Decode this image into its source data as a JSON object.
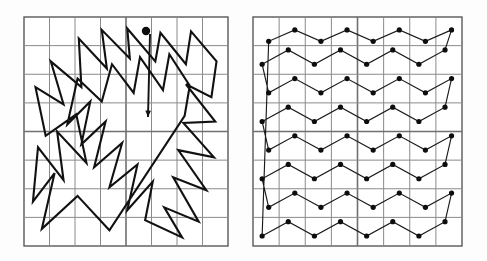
{
  "figure": {
    "background_color": "#fdfdfd",
    "width": 487,
    "height": 261,
    "line_color": "#111111",
    "grid_color": "#8a8a8a",
    "dot_color": "#0d0d0d"
  },
  "panels": [
    {
      "id": "left-panel",
      "label": "Random tour panel",
      "x": 24,
      "y": 17,
      "width": 204,
      "height": 229,
      "columns": 8,
      "rows": 8,
      "major_line_col": 4,
      "major_line_row": 4,
      "has_dots": false,
      "has_start_marker": true,
      "start_marker": {
        "x": 146,
        "y": 31,
        "radius": 4.2
      },
      "arrow": {
        "x1": 150,
        "y1": 34,
        "x2": 148,
        "y2": 117,
        "head_size": 7
      }
    },
    {
      "id": "right-panel",
      "label": "Zigzag tour panel",
      "x": 253,
      "y": 17,
      "width": 209,
      "height": 229,
      "columns": 8,
      "rows": 8,
      "major_line_col": 4,
      "major_line_row": 4,
      "has_dots": true,
      "has_start_marker": false,
      "dot_radius": 2.6,
      "dot_columns": 8,
      "dot_rows": 8
    }
  ],
  "chart_data": {
    "type": "line",
    "xlabel": "",
    "ylabel": "",
    "xlim": [
      0,
      8
    ],
    "ylim": [
      0,
      8
    ],
    "grid": true,
    "legend": "none",
    "series": [
      {
        "name": "Random tour (left panel)",
        "panel": "left-panel",
        "closed": true,
        "points": [
          [
            3.35,
            0.55
          ],
          [
            2.1,
            1.75
          ],
          [
            0.7,
            0.6
          ],
          [
            1.2,
            2.55
          ],
          [
            0.35,
            1.55
          ],
          [
            0.55,
            3.45
          ],
          [
            1.55,
            2.3
          ],
          [
            1.3,
            4.0
          ],
          [
            2.45,
            2.9
          ],
          [
            2.05,
            4.6
          ],
          [
            0.85,
            3.85
          ],
          [
            0.45,
            5.55
          ],
          [
            1.55,
            4.95
          ],
          [
            1.05,
            6.45
          ],
          [
            2.25,
            5.55
          ],
          [
            2.15,
            7.25
          ],
          [
            3.25,
            6.2
          ],
          [
            3.05,
            7.55
          ],
          [
            4.15,
            6.55
          ],
          [
            4.05,
            7.6
          ],
          [
            5.15,
            6.45
          ],
          [
            5.35,
            7.45
          ],
          [
            6.35,
            6.35
          ],
          [
            6.55,
            7.5
          ],
          [
            7.55,
            6.45
          ],
          [
            7.35,
            5.2
          ],
          [
            6.35,
            5.65
          ],
          [
            7.5,
            4.35
          ],
          [
            6.25,
            4.3
          ],
          [
            7.45,
            3.1
          ],
          [
            6.05,
            3.35
          ],
          [
            7.15,
            1.95
          ],
          [
            5.85,
            2.4
          ],
          [
            6.85,
            0.85
          ],
          [
            5.5,
            1.35
          ],
          [
            6.2,
            0.3
          ],
          [
            4.75,
            0.9
          ],
          [
            5.05,
            2.25
          ],
          [
            4.05,
            1.25
          ],
          [
            4.45,
            2.85
          ],
          [
            3.35,
            2.05
          ],
          [
            3.85,
            3.6
          ],
          [
            2.75,
            2.75
          ],
          [
            3.2,
            4.35
          ],
          [
            2.25,
            3.55
          ],
          [
            2.6,
            5.05
          ],
          [
            1.7,
            4.25
          ],
          [
            2.1,
            5.85
          ],
          [
            3.05,
            5.05
          ],
          [
            3.45,
            6.35
          ],
          [
            4.3,
            5.35
          ],
          [
            4.55,
            6.6
          ],
          [
            5.45,
            5.45
          ],
          [
            5.7,
            6.7
          ],
          [
            6.5,
            5.6
          ],
          [
            6.3,
            4.55
          ]
        ]
      },
      {
        "name": "Zigzag tour (right panel)",
        "panel": "right-panel",
        "closed": true,
        "points": [
          [
            0.35,
            0.35
          ],
          [
            1.35,
            0.85
          ],
          [
            2.35,
            0.35
          ],
          [
            3.35,
            0.85
          ],
          [
            4.35,
            0.35
          ],
          [
            5.35,
            0.85
          ],
          [
            6.35,
            0.35
          ],
          [
            7.35,
            0.85
          ],
          [
            7.6,
            1.85
          ],
          [
            6.6,
            1.35
          ],
          [
            5.6,
            1.85
          ],
          [
            4.6,
            1.35
          ],
          [
            3.6,
            1.85
          ],
          [
            2.6,
            1.35
          ],
          [
            1.6,
            1.85
          ],
          [
            0.6,
            1.35
          ],
          [
            0.35,
            2.35
          ],
          [
            1.35,
            2.85
          ],
          [
            2.35,
            2.35
          ],
          [
            3.35,
            2.85
          ],
          [
            4.35,
            2.35
          ],
          [
            5.35,
            2.85
          ],
          [
            6.35,
            2.35
          ],
          [
            7.35,
            2.85
          ],
          [
            7.6,
            3.85
          ],
          [
            6.6,
            3.35
          ],
          [
            5.6,
            3.85
          ],
          [
            4.6,
            3.35
          ],
          [
            3.6,
            3.85
          ],
          [
            2.6,
            3.35
          ],
          [
            1.6,
            3.85
          ],
          [
            0.6,
            3.35
          ],
          [
            0.35,
            4.35
          ],
          [
            1.35,
            4.85
          ],
          [
            2.35,
            4.35
          ],
          [
            3.35,
            4.85
          ],
          [
            4.35,
            4.35
          ],
          [
            5.35,
            4.85
          ],
          [
            6.35,
            4.35
          ],
          [
            7.35,
            4.85
          ],
          [
            7.6,
            5.85
          ],
          [
            6.6,
            5.35
          ],
          [
            5.6,
            5.85
          ],
          [
            4.6,
            5.35
          ],
          [
            3.6,
            5.85
          ],
          [
            2.6,
            5.35
          ],
          [
            1.6,
            5.85
          ],
          [
            0.6,
            5.35
          ],
          [
            0.35,
            6.35
          ],
          [
            1.35,
            6.85
          ],
          [
            2.35,
            6.35
          ],
          [
            3.35,
            6.85
          ],
          [
            4.35,
            6.35
          ],
          [
            5.35,
            6.85
          ],
          [
            6.35,
            6.35
          ],
          [
            7.35,
            6.85
          ],
          [
            7.6,
            7.55
          ],
          [
            6.6,
            7.15
          ],
          [
            5.6,
            7.55
          ],
          [
            4.6,
            7.15
          ],
          [
            3.6,
            7.55
          ],
          [
            2.6,
            7.15
          ],
          [
            1.6,
            7.55
          ],
          [
            0.6,
            7.15
          ]
        ]
      }
    ]
  }
}
